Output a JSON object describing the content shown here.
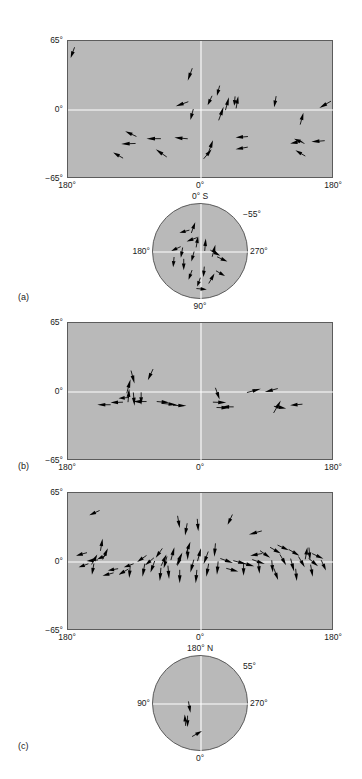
{
  "figure": {
    "type": "vector-field-map-figure",
    "background": "#ffffff",
    "plot_fill": "#b9b9b9",
    "frame_color": "#5c5c5c",
    "grid_color": "#ffffff",
    "arrow_color": "#000000"
  },
  "panels": [
    {
      "tag": "(a)",
      "kind": "rectangular",
      "axes": {
        "y_top": "65°",
        "y_mid": "0°",
        "y_bottom": "−65°",
        "x_left": "180°",
        "x_mid": "0°",
        "x_right": "180°"
      },
      "vectors": [
        {
          "x": 1.0,
          "y": 49.0,
          "a": 200,
          "len": 11
        },
        {
          "x": 45.0,
          "y": 27.5,
          "a": 200,
          "len": 13
        },
        {
          "x": 56.0,
          "y": 13.5,
          "a": 195,
          "len": 10
        },
        {
          "x": 60.5,
          "y": 12.0,
          "a": 15,
          "len": 13
        },
        {
          "x": 64.0,
          "y": 13.0,
          "a": 10,
          "len": 12
        },
        {
          "x": 58.5,
          "y": 3.0,
          "a": 20,
          "len": 14
        },
        {
          "x": 62.5,
          "y": 4.0,
          "a": 185,
          "len": 9
        },
        {
          "x": 52.5,
          "y": 4.5,
          "a": 205,
          "len": 10
        },
        {
          "x": 40.5,
          "y": 3.5,
          "a": 250,
          "len": 13
        },
        {
          "x": 46.0,
          "y": -9.5,
          "a": 195,
          "len": 11
        },
        {
          "x": 77.5,
          "y": 2.5,
          "a": 190,
          "len": 11
        },
        {
          "x": 88.5,
          "y": -2.5,
          "a": 15,
          "len": 12
        },
        {
          "x": 94.5,
          "y": 2.0,
          "a": 240,
          "len": 13
        },
        {
          "x": 21.5,
          "y": -20.0,
          "a": 295,
          "len": 12
        },
        {
          "x": 29.5,
          "y": -27.0,
          "a": 270,
          "len": 14
        },
        {
          "x": 40.0,
          "y": -26.0,
          "a": 275,
          "len": 13
        },
        {
          "x": 20.0,
          "y": -32.0,
          "a": 268,
          "len": 14
        },
        {
          "x": 33.0,
          "y": -37.0,
          "a": 305,
          "len": 13
        },
        {
          "x": 17.0,
          "y": -40.0,
          "a": 300,
          "len": 11
        },
        {
          "x": 54.5,
          "y": -28.5,
          "a": 20,
          "len": 12
        },
        {
          "x": 54.0,
          "y": -37.0,
          "a": 40,
          "len": 12
        },
        {
          "x": 63.0,
          "y": -26.0,
          "a": 265,
          "len": 12
        },
        {
          "x": 63.0,
          "y": -37.0,
          "a": 260,
          "len": 12
        },
        {
          "x": 85.0,
          "y": -27.0,
          "a": 295,
          "len": 11
        },
        {
          "x": 83.5,
          "y": -31.5,
          "a": 260,
          "len": 12
        },
        {
          "x": 91.5,
          "y": -30.0,
          "a": 265,
          "len": 13
        },
        {
          "x": 85.5,
          "y": -38.0,
          "a": 300,
          "len": 11
        }
      ]
    },
    {
      "tag": "(b)",
      "kind": "rectangular",
      "axes": {
        "y_top": "65°",
        "y_mid": "0°",
        "y_bottom": "−65°",
        "x_left": "180°",
        "x_mid": "0°",
        "x_right": "180°"
      },
      "vectors": [
        {
          "x": 23.5,
          "y": 12.0,
          "a": 15,
          "len": 14
        },
        {
          "x": 25.0,
          "y": 8.0,
          "a": 165,
          "len": 13
        },
        {
          "x": 30.0,
          "y": 11.0,
          "a": 205,
          "len": 12
        },
        {
          "x": 23.0,
          "y": 3.0,
          "a": 5,
          "len": 13
        },
        {
          "x": 19.0,
          "y": -6.0,
          "a": 265,
          "len": 10
        },
        {
          "x": 16.0,
          "y": -10.0,
          "a": 268,
          "len": 12
        },
        {
          "x": 11.0,
          "y": -12.0,
          "a": 270,
          "len": 13
        },
        {
          "x": 24.5,
          "y": -9.0,
          "a": 270,
          "len": 13
        },
        {
          "x": 25.0,
          "y": -13.0,
          "a": 175,
          "len": 13
        },
        {
          "x": 27.5,
          "y": -12.0,
          "a": 180,
          "len": 12
        },
        {
          "x": 38.0,
          "y": -10.0,
          "a": 95,
          "len": 12
        },
        {
          "x": 41.0,
          "y": -12.0,
          "a": 95,
          "len": 15
        },
        {
          "x": 44.5,
          "y": -13.0,
          "a": 92,
          "len": 13
        },
        {
          "x": 57.0,
          "y": -7.0,
          "a": 160,
          "len": 12
        },
        {
          "x": 59.5,
          "y": -10.0,
          "a": 92,
          "len": 13
        },
        {
          "x": 58.0,
          "y": -14.0,
          "a": 270,
          "len": 11
        },
        {
          "x": 60.5,
          "y": -15.0,
          "a": 92,
          "len": 12
        },
        {
          "x": 72.5,
          "y": 3.0,
          "a": 75,
          "len": 14
        },
        {
          "x": 74.0,
          "y": 0.0,
          "a": 255,
          "len": 13
        },
        {
          "x": 80.0,
          "y": -8.0,
          "a": 30,
          "len": 14
        },
        {
          "x": 83.5,
          "y": -12.5,
          "a": 265,
          "len": 12
        },
        {
          "x": 82.0,
          "y": -15.5,
          "a": 100,
          "len": 12
        }
      ]
    },
    {
      "tag": "(c)",
      "kind": "rectangular",
      "axes": {
        "y_top": "65°",
        "y_mid": "0°",
        "y_bottom": "−65°",
        "x_left": "180°",
        "x_mid": "0°",
        "x_right": "180°"
      },
      "vectors": [
        {
          "x": 8.0,
          "y": 44.0,
          "a": 245,
          "len": 11
        },
        {
          "x": 13.0,
          "y": 22.0,
          "a": 10,
          "len": 12
        },
        {
          "x": 15.0,
          "y": 13.0,
          "a": 25,
          "len": 12
        },
        {
          "x": 11.0,
          "y": 7.0,
          "a": 30,
          "len": 11
        },
        {
          "x": 3.0,
          "y": 6.0,
          "a": 255,
          "len": 11
        },
        {
          "x": 7.0,
          "y": 1.0,
          "a": 265,
          "len": 11
        },
        {
          "x": 11.0,
          "y": 2.5,
          "a": 245,
          "len": 10
        },
        {
          "x": 4.0,
          "y": -5.0,
          "a": 250,
          "len": 10
        },
        {
          "x": 9.0,
          "y": -12.0,
          "a": 190,
          "len": 11
        },
        {
          "x": 13.0,
          "y": -13.0,
          "a": 255,
          "len": 11
        },
        {
          "x": 15.0,
          "y": -8.0,
          "a": 260,
          "len": 10
        },
        {
          "x": 19.0,
          "y": -12.0,
          "a": 240,
          "len": 11
        },
        {
          "x": 21.0,
          "y": -5.0,
          "a": 250,
          "len": 10
        },
        {
          "x": 23.0,
          "y": -15.0,
          "a": 185,
          "len": 12
        },
        {
          "x": 26.0,
          "y": 0.0,
          "a": 235,
          "len": 11
        },
        {
          "x": 29.0,
          "y": -3.0,
          "a": 230,
          "len": 11
        },
        {
          "x": 28.0,
          "y": -14.0,
          "a": 190,
          "len": 13
        },
        {
          "x": 31.0,
          "y": -10.0,
          "a": 200,
          "len": 12
        },
        {
          "x": 33.0,
          "y": 4.0,
          "a": 215,
          "len": 11
        },
        {
          "x": 36.0,
          "y": -6.0,
          "a": 195,
          "len": 12
        },
        {
          "x": 34.5,
          "y": -18.0,
          "a": 185,
          "len": 13
        },
        {
          "x": 38.0,
          "y": -16.0,
          "a": 175,
          "len": 13
        },
        {
          "x": 37.0,
          "y": 7.0,
          "a": 25,
          "len": 12
        },
        {
          "x": 40.0,
          "y": 14.0,
          "a": 15,
          "len": 13
        },
        {
          "x": 42.0,
          "y": 32.0,
          "a": 170,
          "len": 12
        },
        {
          "x": 44.0,
          "y": 25.0,
          "a": 190,
          "len": 12
        },
        {
          "x": 46.0,
          "y": 19.0,
          "a": 20,
          "len": 12
        },
        {
          "x": 43.0,
          "y": 9.0,
          "a": 25,
          "len": 13
        },
        {
          "x": 45.0,
          "y": 2.0,
          "a": 180,
          "len": 13
        },
        {
          "x": 41.0,
          "y": -4.0,
          "a": 200,
          "len": 12
        },
        {
          "x": 42.0,
          "y": -20.0,
          "a": 180,
          "len": 13
        },
        {
          "x": 46.0,
          "y": -10.0,
          "a": 195,
          "len": 13
        },
        {
          "x": 48.0,
          "y": -20.0,
          "a": 185,
          "len": 13
        },
        {
          "x": 49.0,
          "y": 29.0,
          "a": 175,
          "len": 12
        },
        {
          "x": 50.0,
          "y": 13.0,
          "a": 15,
          "len": 13
        },
        {
          "x": 51.0,
          "y": -2.0,
          "a": 200,
          "len": 13
        },
        {
          "x": 52.0,
          "y": -14.0,
          "a": 190,
          "len": 13
        },
        {
          "x": 55.0,
          "y": 5.0,
          "a": 185,
          "len": 13
        },
        {
          "x": 56.0,
          "y": -12.0,
          "a": 185,
          "len": 13
        },
        {
          "x": 60.0,
          "y": 35.0,
          "a": 205,
          "len": 11
        },
        {
          "x": 62.0,
          "y": -1.0,
          "a": 110,
          "len": 13
        },
        {
          "x": 64.0,
          "y": -9.0,
          "a": 105,
          "len": 12
        },
        {
          "x": 67.0,
          "y": -2.0,
          "a": 105,
          "len": 13
        },
        {
          "x": 66.0,
          "y": -13.0,
          "a": 180,
          "len": 12
        },
        {
          "x": 70.0,
          "y": -4.0,
          "a": 105,
          "len": 13
        },
        {
          "x": 72.0,
          "y": -11.0,
          "a": 175,
          "len": 12
        },
        {
          "x": 68.0,
          "y": 26.0,
          "a": 255,
          "len": 13
        },
        {
          "x": 68.5,
          "y": 6.0,
          "a": 260,
          "len": 12
        },
        {
          "x": 74.0,
          "y": -2.0,
          "a": 110,
          "len": 13
        },
        {
          "x": 76.0,
          "y": 4.0,
          "a": 125,
          "len": 12
        },
        {
          "x": 77.0,
          "y": -10.0,
          "a": 175,
          "len": 12
        },
        {
          "x": 79.0,
          "y": -17.0,
          "a": 160,
          "len": 12
        },
        {
          "x": 80.0,
          "y": 8.0,
          "a": 120,
          "len": 12
        },
        {
          "x": 82.0,
          "y": -3.0,
          "a": 150,
          "len": 12
        },
        {
          "x": 83.0,
          "y": 11.0,
          "a": 115,
          "len": 12
        },
        {
          "x": 85.0,
          "y": -9.0,
          "a": 165,
          "len": 13
        },
        {
          "x": 86.0,
          "y": -18.0,
          "a": 175,
          "len": 12
        },
        {
          "x": 87.0,
          "y": 6.0,
          "a": 120,
          "len": 12
        },
        {
          "x": 89.0,
          "y": -5.0,
          "a": 150,
          "len": 12
        },
        {
          "x": 90.0,
          "y": 14.0,
          "a": 10,
          "len": 12
        },
        {
          "x": 91.0,
          "y": 2.0,
          "a": 175,
          "len": 12
        },
        {
          "x": 92.0,
          "y": -14.0,
          "a": 170,
          "len": 12
        },
        {
          "x": 94.0,
          "y": -4.0,
          "a": 130,
          "len": 12
        },
        {
          "x": 96.0,
          "y": 3.0,
          "a": 115,
          "len": 12
        },
        {
          "x": 97.0,
          "y": -8.0,
          "a": 155,
          "len": 11
        }
      ]
    }
  ],
  "insets": [
    {
      "id": "inset-south",
      "labels": {
        "top": "0° S",
        "upper_right": "−55°",
        "left": "180°",
        "right": "270°",
        "bottom": "90°"
      },
      "vectors": [
        {
          "x": -0.12,
          "y": 0.62,
          "a": 20,
          "len": 11
        },
        {
          "x": -0.45,
          "y": 0.4,
          "a": 255,
          "len": 10
        },
        {
          "x": -0.3,
          "y": 0.22,
          "a": 250,
          "len": 11
        },
        {
          "x": -0.62,
          "y": 0.02,
          "a": 245,
          "len": 10
        },
        {
          "x": -0.42,
          "y": -0.12,
          "a": 190,
          "len": 10
        },
        {
          "x": -0.58,
          "y": -0.32,
          "a": 185,
          "len": 10
        },
        {
          "x": -0.36,
          "y": -0.38,
          "a": 180,
          "len": 11
        },
        {
          "x": -0.2,
          "y": -0.2,
          "a": 195,
          "len": 10
        },
        {
          "x": -0.26,
          "y": -0.58,
          "a": 200,
          "len": 10
        },
        {
          "x": -0.08,
          "y": -0.72,
          "a": 200,
          "len": 9
        },
        {
          "x": 0.05,
          "y": -0.52,
          "a": 185,
          "len": 10
        },
        {
          "x": 0.1,
          "y": 0.28,
          "a": 5,
          "len": 12
        },
        {
          "x": 0.3,
          "y": 0.15,
          "a": 15,
          "len": 12
        },
        {
          "x": 0.4,
          "y": -0.08,
          "a": 120,
          "len": 11
        },
        {
          "x": 0.55,
          "y": -0.2,
          "a": 115,
          "len": 11
        },
        {
          "x": 0.28,
          "y": -0.45,
          "a": 30,
          "len": 11
        },
        {
          "x": 0.5,
          "y": -0.5,
          "a": 120,
          "len": 10
        },
        {
          "x": 0.12,
          "y": -0.78,
          "a": 95,
          "len": 10
        },
        {
          "x": -0.06,
          "y": 0.33,
          "a": 10,
          "len": 11
        }
      ]
    },
    {
      "id": "inset-north",
      "labels": {
        "top": "180° N",
        "upper_right": "55°",
        "left": "90°",
        "right": "270°",
        "bottom": "0°"
      },
      "vectors": [
        {
          "x": -0.34,
          "y": -0.22,
          "a": 355,
          "len": 11
        },
        {
          "x": -0.22,
          "y": -0.18,
          "a": 170,
          "len": 11
        },
        {
          "x": -0.28,
          "y": -0.48,
          "a": 180,
          "len": 11
        },
        {
          "x": 0.02,
          "y": -0.56,
          "a": 60,
          "len": 11
        }
      ]
    }
  ]
}
